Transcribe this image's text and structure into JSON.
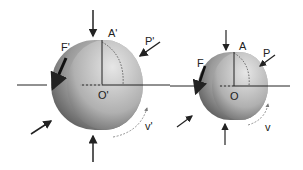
{
  "figure": {
    "left_sphere": {
      "labels": {
        "top": "A'",
        "force": "F'",
        "pressure": "P'",
        "center": "O'",
        "velocity": "v'"
      }
    },
    "right_sphere": {
      "labels": {
        "top": "A",
        "force": "F",
        "pressure": "P",
        "center": "O",
        "velocity": "v"
      }
    },
    "colors": {
      "line": "#222222",
      "shade_dark": "#4a4a4a",
      "shade_light": "#d9d9d9"
    }
  }
}
